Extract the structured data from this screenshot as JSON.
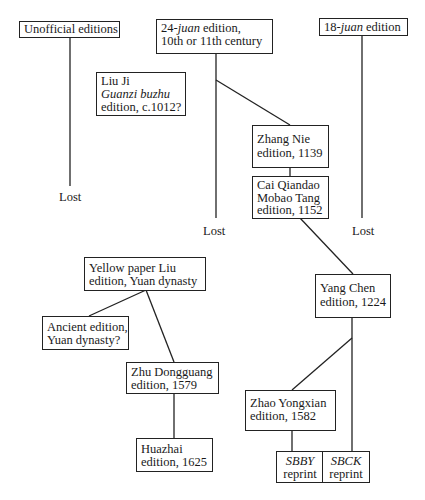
{
  "diagram": {
    "type": "edition-stemma",
    "nodes": {
      "unofficial": {
        "lines": [
          {
            "parts": [
              {
                "text": "Unofficial editions",
                "italic": false
              }
            ]
          }
        ]
      },
      "juan24": {
        "lines": [
          {
            "parts": [
              {
                "text": "24-",
                "italic": false
              },
              {
                "text": "juan",
                "italic": true
              },
              {
                "text": " edition,",
                "italic": false
              }
            ]
          },
          {
            "parts": [
              {
                "text": "10th or 11th century",
                "italic": false
              }
            ]
          }
        ]
      },
      "juan18": {
        "lines": [
          {
            "parts": [
              {
                "text": "18-",
                "italic": false
              },
              {
                "text": "juan",
                "italic": true
              },
              {
                "text": " edition",
                "italic": false
              }
            ]
          }
        ]
      },
      "liuji": {
        "lines": [
          {
            "parts": [
              {
                "text": "Liu Ji",
                "italic": false
              }
            ]
          },
          {
            "parts": [
              {
                "text": "Guanzi buzhu",
                "italic": true
              }
            ]
          },
          {
            "parts": [
              {
                "text": "edition, c.1012?",
                "italic": false
              }
            ]
          }
        ]
      },
      "zhangnie": {
        "lines": [
          {
            "parts": [
              {
                "text": "Zhang Nie",
                "italic": false
              }
            ]
          },
          {
            "parts": [
              {
                "text": "edition, 1139",
                "italic": false
              }
            ]
          }
        ]
      },
      "caiqiandao": {
        "lines": [
          {
            "parts": [
              {
                "text": "Cai Qiandao",
                "italic": false
              }
            ]
          },
          {
            "parts": [
              {
                "text": "Mobao Tang",
                "italic": false
              }
            ]
          },
          {
            "parts": [
              {
                "text": "edition, 1152",
                "italic": false
              }
            ]
          }
        ]
      },
      "yangchen": {
        "lines": [
          {
            "parts": [
              {
                "text": "Yang Chen",
                "italic": false
              }
            ]
          },
          {
            "parts": [
              {
                "text": "edition, 1224",
                "italic": false
              }
            ]
          }
        ]
      },
      "yellowpaper": {
        "lines": [
          {
            "parts": [
              {
                "text": "Yellow paper Liu",
                "italic": false
              }
            ]
          },
          {
            "parts": [
              {
                "text": "edition, Yuan dynasty",
                "italic": false
              }
            ]
          }
        ]
      },
      "ancient": {
        "lines": [
          {
            "parts": [
              {
                "text": "Ancient edition,",
                "italic": false
              }
            ]
          },
          {
            "parts": [
              {
                "text": "Yuan dynasty?",
                "italic": false
              }
            ]
          }
        ]
      },
      "zhudongguang": {
        "lines": [
          {
            "parts": [
              {
                "text": "Zhu Dongguang",
                "italic": false
              }
            ]
          },
          {
            "parts": [
              {
                "text": "edition, 1579",
                "italic": false
              }
            ]
          }
        ]
      },
      "huazhai": {
        "lines": [
          {
            "parts": [
              {
                "text": "Huazhai",
                "italic": false
              }
            ]
          },
          {
            "parts": [
              {
                "text": "edition, 1625",
                "italic": false
              }
            ]
          }
        ]
      },
      "zhaoyongxian": {
        "lines": [
          {
            "parts": [
              {
                "text": "Zhao Yongxian",
                "italic": false
              }
            ]
          },
          {
            "parts": [
              {
                "text": "edition, 1582",
                "italic": false
              }
            ]
          }
        ]
      },
      "sbby": {
        "lines": [
          {
            "parts": [
              {
                "text": "SBBY",
                "italic": true
              }
            ]
          },
          {
            "parts": [
              {
                "text": "reprint",
                "italic": false
              }
            ]
          }
        ]
      },
      "sbck": {
        "lines": [
          {
            "parts": [
              {
                "text": "SBCK",
                "italic": true
              }
            ]
          },
          {
            "parts": [
              {
                "text": "reprint",
                "italic": false
              }
            ]
          }
        ]
      }
    },
    "lost_labels": {
      "unofficial_lost": "Lost",
      "juan24_lost": "Lost",
      "juan18_lost": "Lost"
    },
    "edges": [
      {
        "from": "unofficial",
        "to": "unofficial_lost"
      },
      {
        "from": "juan24",
        "to": "juan24_lost"
      },
      {
        "from": "juan24",
        "to": "zhangnie"
      },
      {
        "from": "juan18",
        "to": "juan18_lost"
      },
      {
        "from": "zhangnie",
        "to": "caiqiandao"
      },
      {
        "from": "caiqiandao",
        "to": "yangchen"
      },
      {
        "from": "yangchen",
        "to": "zhaoyongxian"
      },
      {
        "from": "yangchen",
        "to": "sbck"
      },
      {
        "from": "zhaoyongxian",
        "to": "sbby"
      },
      {
        "from": "yellowpaper",
        "to": "ancient"
      },
      {
        "from": "yellowpaper",
        "to": "zhudongguang"
      },
      {
        "from": "zhudongguang",
        "to": "huazhai"
      }
    ],
    "colors": {
      "line": "#222222",
      "background": "#ffffff",
      "text": "#1a1a1a"
    }
  }
}
